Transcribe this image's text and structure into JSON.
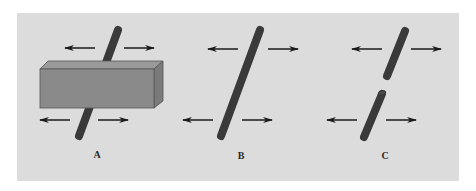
{
  "figure": {
    "background_color": "#ffffff",
    "panel_color": "#dcdcdc",
    "rod_color": "#3a3a3a",
    "arrow_color": "#1a1a1a",
    "box": {
      "front_color": "#8a8a8a",
      "top_color": "#9a9a9a",
      "side_color": "#7a7a7a",
      "edge_color": "#555555"
    }
  },
  "panels": [
    {
      "label": "A",
      "description": "Rod partially occluded by a horizontal box; visible top and bottom segments move horizontally",
      "arrows": [
        "left",
        "right",
        "left",
        "right"
      ]
    },
    {
      "label": "B",
      "description": "Single continuous rod moving horizontally",
      "arrows": [
        "left",
        "right",
        "left",
        "right"
      ]
    },
    {
      "label": "C",
      "description": "Two separate rod segments moving horizontally",
      "arrows": [
        "left",
        "right",
        "left",
        "right"
      ]
    }
  ]
}
